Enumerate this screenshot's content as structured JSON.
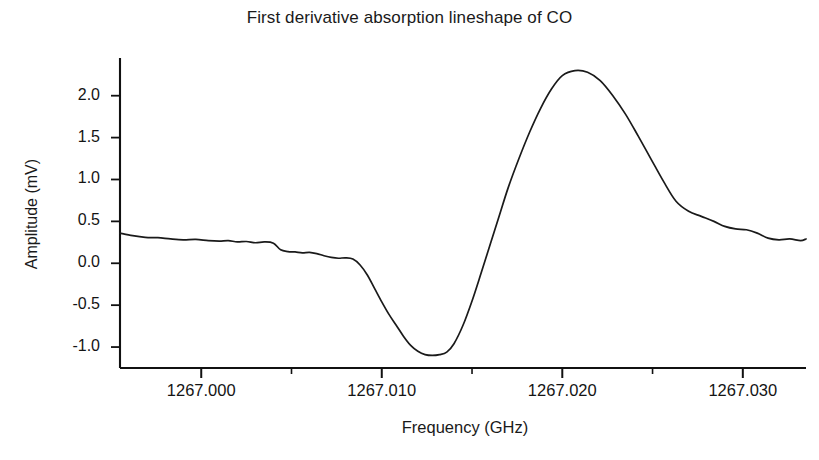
{
  "chart_data": {
    "type": "line",
    "title": "First derivative absorption lineshape of CO",
    "xlabel": "Frequency (GHz)",
    "ylabel": "Amplitude (mV)",
    "xlim": [
      1266.9955,
      1267.0335
    ],
    "ylim": [
      -1.25,
      2.45
    ],
    "grid": false,
    "legend": "none",
    "x_tick_labels": [
      "1267.000",
      "1267.010",
      "1267.020",
      "1267.030"
    ],
    "x_tick_values": [
      1267.0,
      1267.01,
      1267.02,
      1267.03
    ],
    "x_minor_tick_values": [
      1267.005,
      1267.015,
      1267.025
    ],
    "y_tick_labels": [
      "-1.0",
      "-0.5",
      "0.0",
      "0.5",
      "1.0",
      "1.5",
      "2.0"
    ],
    "y_tick_values": [
      -1.0,
      -0.5,
      0.0,
      0.5,
      1.0,
      1.5,
      2.0
    ],
    "series": [
      {
        "name": "First derivative absorption lineshape of CO",
        "color": "#1a1a1a",
        "x": [
          1266.9955,
          1266.9962,
          1266.9969,
          1266.9976,
          1266.9983,
          1266.999,
          1266.9997,
          1267.0004,
          1267.001,
          1267.0015,
          1267.002,
          1267.0025,
          1267.003,
          1267.0035,
          1267.004,
          1267.0044,
          1267.0048,
          1267.0052,
          1267.0056,
          1267.006,
          1267.0064,
          1267.0068,
          1267.0072,
          1267.0076,
          1267.008,
          1267.0084,
          1267.0088,
          1267.0092,
          1267.0096,
          1267.01,
          1267.0104,
          1267.0108,
          1267.0112,
          1267.0116,
          1267.012,
          1267.0124,
          1267.0128,
          1267.0132,
          1267.0136,
          1267.014,
          1267.0145,
          1267.015,
          1267.0155,
          1267.016,
          1267.0165,
          1267.017,
          1267.0176,
          1267.0182,
          1267.0188,
          1267.0194,
          1267.02,
          1267.0207,
          1267.0214,
          1267.0221,
          1267.0228,
          1267.0235,
          1267.0242,
          1267.0249,
          1267.0256,
          1267.0263,
          1267.027,
          1267.0277,
          1267.0284,
          1267.029,
          1267.0296,
          1267.0302,
          1267.0308,
          1267.0314,
          1267.032,
          1267.0326,
          1267.0332,
          1267.0335
        ],
        "y": [
          0.36,
          0.33,
          0.31,
          0.305,
          0.29,
          0.28,
          0.285,
          0.27,
          0.265,
          0.27,
          0.255,
          0.26,
          0.245,
          0.255,
          0.24,
          0.16,
          0.14,
          0.135,
          0.125,
          0.13,
          0.115,
          0.09,
          0.07,
          0.06,
          0.065,
          0.05,
          -0.02,
          -0.14,
          -0.3,
          -0.46,
          -0.61,
          -0.74,
          -0.87,
          -0.98,
          -1.05,
          -1.09,
          -1.1,
          -1.09,
          -1.06,
          -0.96,
          -0.74,
          -0.45,
          -0.12,
          0.22,
          0.56,
          0.9,
          1.25,
          1.57,
          1.85,
          2.08,
          2.24,
          2.3,
          2.28,
          2.18,
          2.0,
          1.78,
          1.52,
          1.25,
          0.98,
          0.74,
          0.62,
          0.56,
          0.5,
          0.44,
          0.41,
          0.4,
          0.36,
          0.3,
          0.28,
          0.29,
          0.27,
          0.29
        ]
      }
    ],
    "tail_detail": {
      "x": [
        1267.0206,
        1267.0213,
        1267.022,
        1267.0227,
        1267.0234,
        1267.0241,
        1267.0248,
        1267.0255,
        1267.0262,
        1267.0269,
        1267.0276,
        1267.0283,
        1267.029,
        1267.0297,
        1267.0304,
        1267.0311,
        1267.0318,
        1267.0325,
        1267.0332,
        1267.0335
      ],
      "y": [
        0.62,
        0.58,
        0.55,
        0.5,
        0.46,
        0.43,
        0.42,
        0.4,
        0.36,
        0.3,
        0.27,
        0.28,
        0.27,
        0.29,
        0.3,
        0.31,
        0.3,
        0.24,
        0.3,
        0.36
      ]
    }
  },
  "axes": {
    "title": "First derivative absorption lineshape of CO",
    "x_axis_label": "Frequency (GHz)",
    "y_axis_label": "Amplitude (mV)",
    "x_ticks": [
      {
        "label": "1267.000",
        "value": 1267.0
      },
      {
        "label": "1267.010",
        "value": 1267.01
      },
      {
        "label": "1267.020",
        "value": 1267.02
      },
      {
        "label": "1267.030",
        "value": 1267.03
      }
    ],
    "y_ticks": [
      {
        "label": "2.0",
        "value": 2.0
      },
      {
        "label": "1.5",
        "value": 1.5
      },
      {
        "label": "1.0",
        "value": 1.0
      },
      {
        "label": "0.5",
        "value": 0.5
      },
      {
        "label": "0.0",
        "value": 0.0
      },
      {
        "label": "-0.5",
        "value": -0.5
      },
      {
        "label": "-1.0",
        "value": -1.0
      }
    ]
  },
  "colors": {
    "curve": "#1a1a1a",
    "axis": "#111111",
    "background": "#ffffff",
    "text": "#141414"
  }
}
